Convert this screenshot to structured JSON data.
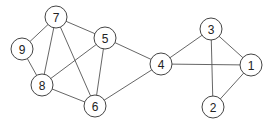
{
  "graph": {
    "node_radius": 11,
    "colors": {
      "edge": "#555555",
      "node_stroke": "#444444",
      "node_fill": "#ffffff",
      "label": "#222222"
    },
    "nodes": [
      {
        "id": "1",
        "label": "1",
        "x": 251,
        "y": 65
      },
      {
        "id": "2",
        "label": "2",
        "x": 213,
        "y": 107
      },
      {
        "id": "3",
        "label": "3",
        "x": 211,
        "y": 29
      },
      {
        "id": "4",
        "label": "4",
        "x": 161,
        "y": 64
      },
      {
        "id": "5",
        "label": "5",
        "x": 105,
        "y": 38
      },
      {
        "id": "6",
        "label": "6",
        "x": 95,
        "y": 106
      },
      {
        "id": "7",
        "label": "7",
        "x": 56,
        "y": 17
      },
      {
        "id": "8",
        "label": "8",
        "x": 42,
        "y": 85
      },
      {
        "id": "9",
        "label": "9",
        "x": 22,
        "y": 49
      }
    ],
    "edges": [
      [
        "7",
        "9"
      ],
      [
        "7",
        "8"
      ],
      [
        "7",
        "5"
      ],
      [
        "7",
        "6"
      ],
      [
        "9",
        "8"
      ],
      [
        "8",
        "5"
      ],
      [
        "8",
        "6"
      ],
      [
        "5",
        "6"
      ],
      [
        "5",
        "4"
      ],
      [
        "6",
        "4"
      ],
      [
        "4",
        "3"
      ],
      [
        "4",
        "1"
      ],
      [
        "3",
        "1"
      ],
      [
        "3",
        "2"
      ],
      [
        "1",
        "2"
      ]
    ]
  }
}
